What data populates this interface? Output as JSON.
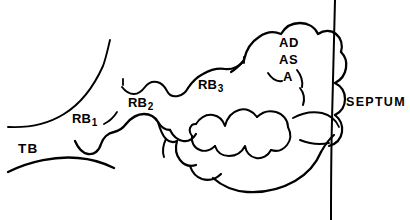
{
  "figure": {
    "background_color": "#ffffff",
    "ink_color": "#000000",
    "width": 410,
    "height": 220
  },
  "labels": {
    "terminal_bronchiole": "TB",
    "respiratory_bronchiole_1_base": "RB",
    "respiratory_bronchiole_1_sub": "1",
    "respiratory_bronchiole_2_base": "RB",
    "respiratory_bronchiole_2_sub": "2",
    "respiratory_bronchiole_3_base": "RB",
    "respiratory_bronchiole_3_sub": "3",
    "alveolar_duct": "AD",
    "alveolar_sac": "AS",
    "alveolus": "A",
    "septum": "SEPTUM"
  },
  "structures": [
    {
      "name": "terminal-bronchiole",
      "abbreviation": "TB",
      "description": "funnel-shaped airway opening at the left edge"
    },
    {
      "name": "respiratory-bronchiole-first-order",
      "abbreviation": "RB1",
      "description": "first generation respiratory bronchiole with alveolar outpouchings"
    },
    {
      "name": "respiratory-bronchiole-second-order",
      "abbreviation": "RB2",
      "description": "second generation respiratory bronchiole, scalloped walls"
    },
    {
      "name": "respiratory-bronchiole-third-order",
      "abbreviation": "RB3",
      "description": "third generation respiratory bronchiole entering the alveolated zone"
    },
    {
      "name": "alveolar-duct",
      "abbreviation": "AD",
      "description": "alveolated duct within the acinar cluster"
    },
    {
      "name": "alveolar-sac",
      "abbreviation": "AS",
      "description": "terminal alveolar sac"
    },
    {
      "name": "alveolus",
      "abbreviation": "A",
      "description": "single alveolus"
    },
    {
      "name": "interlobular-septum",
      "abbreviation": "SEPTUM",
      "description": "near-vertical boundary line at the right side of the drawing"
    }
  ]
}
